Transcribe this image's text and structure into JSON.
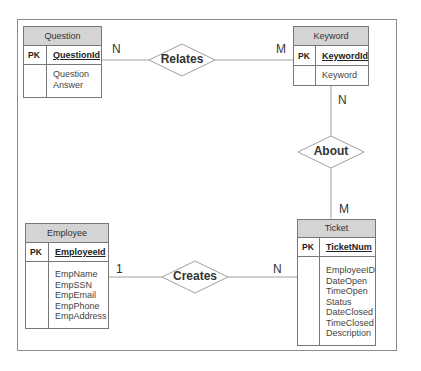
{
  "diagram": {
    "type": "entity-relationship",
    "entities": [
      {
        "name": "Question",
        "pk_label": "PK",
        "pk": "QuestionId",
        "attributes": [
          "Question",
          "Answer"
        ]
      },
      {
        "name": "Keyword",
        "pk_label": "PK",
        "pk": "KeywordId",
        "attributes": [
          "Keyword"
        ]
      },
      {
        "name": "Employee",
        "pk_label": "PK",
        "pk": "EmployeeId",
        "attributes": [
          "EmpName",
          "EmpSSN",
          "EmpEmail",
          "EmpPhone",
          "EmpAddress"
        ]
      },
      {
        "name": "Ticket",
        "pk_label": "PK",
        "pk": "TicketNum",
        "attributes": [
          "EmployeeID",
          "DateOpen",
          "TimeOpen",
          "Status",
          "DateClosed",
          "TimeClosed",
          "Description"
        ]
      }
    ],
    "relationships": [
      {
        "name": "Relates",
        "from": "Question",
        "from_card": "N",
        "to": "Keyword",
        "to_card": "M"
      },
      {
        "name": "About",
        "from": "Keyword",
        "from_card": "N",
        "to": "Ticket",
        "to_card": "M"
      },
      {
        "name": "Creates",
        "from": "Employee",
        "from_card": "1",
        "to": "Ticket",
        "to_card": "N"
      }
    ],
    "colors": {
      "header_fill": "#d4d4d4",
      "border": "#777777",
      "line": "#999999"
    }
  }
}
